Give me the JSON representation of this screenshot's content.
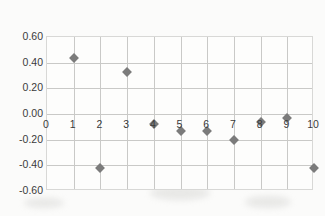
{
  "chart_data": {
    "type": "scatter",
    "title": "",
    "xlabel": "",
    "ylabel": "",
    "xlim": [
      0,
      10
    ],
    "ylim": [
      -0.6,
      0.6
    ],
    "grid": true,
    "legend": false,
    "marker": "diamond",
    "marker_color": "#7b7b7b",
    "x": [
      1,
      2,
      3,
      4,
      5,
      6,
      7,
      8,
      9,
      10
    ],
    "values": [
      0.44,
      -0.42,
      0.33,
      -0.08,
      -0.13,
      -0.13,
      -0.2,
      -0.06,
      -0.03,
      -0.42
    ],
    "series": [
      {
        "name": "Series 1",
        "x": [
          1,
          2,
          3,
          4,
          5,
          6,
          7,
          8,
          9,
          10
        ],
        "values": [
          0.44,
          -0.42,
          0.33,
          -0.08,
          -0.13,
          -0.13,
          -0.2,
          -0.06,
          -0.03,
          -0.42
        ]
      }
    ],
    "x_tick_labels": [
      "0",
      "1",
      "2",
      "3",
      "4",
      "5",
      "6",
      "7",
      "8",
      "9",
      "10"
    ],
    "y_tick_labels": [
      "0.60",
      "0.40",
      "0.20",
      "0.00",
      "-0.20",
      "-0.40",
      "-0.60"
    ],
    "y_tick_values": [
      0.6,
      0.4,
      0.2,
      0.0,
      -0.2,
      -0.4,
      -0.6
    ],
    "x_axis_label_position": "on-zero-line",
    "colors": {
      "marker": "#7b7b7b",
      "gridline": "#c9c9c7",
      "plot_border": "#d8d8d6",
      "plot_background": "#fdfdfc",
      "page_background": "#f7f6f4",
      "tick_text": "#3a3a3a"
    }
  }
}
